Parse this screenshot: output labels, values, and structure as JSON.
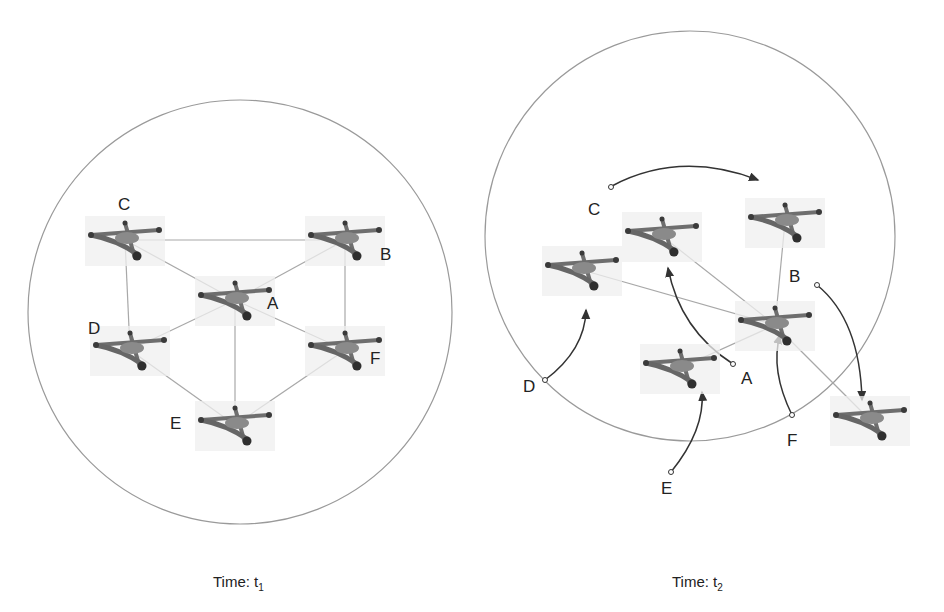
{
  "panels": [
    {
      "id": "t1",
      "caption": {
        "prefix": "Time: t",
        "subscript": "1"
      },
      "circle": {
        "cx": 240,
        "cy": 312,
        "r": 212
      },
      "nodes": [
        {
          "label": "C",
          "x": 125,
          "y": 240,
          "label_x": 118,
          "label_y": 196
        },
        {
          "label": "B",
          "x": 345,
          "y": 240,
          "label_x": 380,
          "label_y": 246
        },
        {
          "label": "A",
          "x": 235,
          "y": 300,
          "label_x": 267,
          "label_y": 295
        },
        {
          "label": "D",
          "x": 130,
          "y": 350,
          "label_x": 88,
          "label_y": 320
        },
        {
          "label": "F",
          "x": 345,
          "y": 350,
          "label_x": 370,
          "label_y": 350
        },
        {
          "label": "E",
          "x": 235,
          "y": 425,
          "label_x": 170,
          "label_y": 415
        }
      ],
      "links": [
        [
          "C",
          "B"
        ],
        [
          "C",
          "A"
        ],
        [
          "B",
          "A"
        ],
        [
          "C",
          "D"
        ],
        [
          "B",
          "F"
        ],
        [
          "A",
          "D"
        ],
        [
          "A",
          "F"
        ],
        [
          "A",
          "E"
        ],
        [
          "D",
          "E"
        ],
        [
          "F",
          "E"
        ]
      ]
    },
    {
      "id": "t2",
      "caption": {
        "prefix": "Time: t",
        "subscript": "2"
      },
      "circle": {
        "cx": 690,
        "cy": 236,
        "r": 205
      },
      "nodes": [
        {
          "id": "n_left",
          "x": 582,
          "y": 270
        },
        {
          "id": "n_top_mid",
          "x": 662,
          "y": 236
        },
        {
          "id": "n_top_right",
          "x": 785,
          "y": 222
        },
        {
          "id": "n_center",
          "x": 775,
          "y": 325
        },
        {
          "id": "n_bottom",
          "x": 680,
          "y": 368
        },
        {
          "id": "n_outside",
          "x": 870,
          "y": 420
        }
      ],
      "labels": [
        {
          "text": "C",
          "x": 588,
          "y": 201
        },
        {
          "text": "B",
          "x": 789,
          "y": 268
        },
        {
          "text": "A",
          "x": 741,
          "y": 370
        },
        {
          "text": "D",
          "x": 523,
          "y": 378
        },
        {
          "text": "F",
          "x": 787,
          "y": 432
        },
        {
          "text": "E",
          "x": 661,
          "y": 480
        }
      ],
      "links": [
        [
          "n_left",
          "n_center"
        ],
        [
          "n_top_mid",
          "n_center"
        ],
        [
          "n_top_right",
          "n_center"
        ],
        [
          "n_bottom",
          "n_center"
        ],
        [
          "n_center",
          "n_outside"
        ]
      ],
      "motion_arrows": [
        {
          "name": "c-motion-arrow",
          "d": "M612,186 Q680,150 758,180",
          "start": [
            611,
            187
          ]
        },
        {
          "name": "b-motion-arrow",
          "d": "M817,285 Q860,320 862,400",
          "start": [
            817,
            285
          ]
        },
        {
          "name": "a-motion-arrow",
          "d": "M733,364 Q680,330 668,268",
          "start": [
            733,
            364
          ]
        },
        {
          "name": "d-motion-arrow",
          "d": "M545,380 Q585,350 586,310",
          "start": [
            545,
            380
          ]
        },
        {
          "name": "f-motion-arrow",
          "d": "M792,415 Q770,370 780,335",
          "start": [
            792,
            415
          ]
        },
        {
          "name": "e-motion-arrow",
          "d": "M671,472 Q705,430 702,392",
          "start": [
            671,
            472
          ]
        }
      ]
    }
  ],
  "colors": {
    "circle": "#9a9a9a",
    "link": "#a8a8a8",
    "arrow": "#333333",
    "drone_body": "#7a7a7a",
    "drone_dark": "#3a3a3a",
    "drone_bg": "#efefef"
  }
}
